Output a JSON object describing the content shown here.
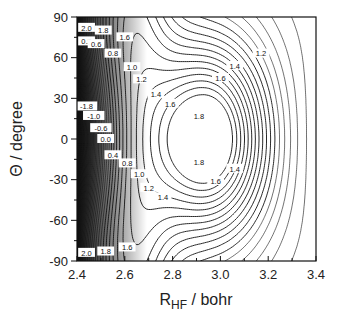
{
  "chart_data": {
    "type": "contour",
    "title": "",
    "xlabel": "R_HF / bohr",
    "xlabel_main": "R",
    "xlabel_sub": "HF",
    "xlabel_rest": " / bohr",
    "ylabel": "Θ / degree",
    "xlim": [
      2.4,
      3.4
    ],
    "ylim": [
      -90,
      90
    ],
    "xticks": [
      "2.4",
      "2.6",
      "2.8",
      "3.0",
      "3.2",
      "3.4"
    ],
    "yticks": [
      "90",
      "60",
      "30",
      "0",
      "-30",
      "-60",
      "-90"
    ],
    "grid": false,
    "legend": null,
    "minimum_region": {
      "R": 2.95,
      "Theta": 0,
      "max_level": 1.8
    },
    "saddle_region": {
      "R": 3.1,
      "Theta": 90
    },
    "contour_levels_labeled": [
      "-1.8",
      "-1.0",
      "-0.6",
      "0.0",
      "0.2",
      "0.4",
      "0.6",
      "0.8",
      "1.0",
      "1.2",
      "1.4",
      "1.6",
      "1.8",
      "2.0"
    ],
    "labels": [
      {
        "text": "2.0",
        "R": 2.44,
        "Theta": 82
      },
      {
        "text": "1.8",
        "R": 2.51,
        "Theta": 80
      },
      {
        "text": "1.6",
        "R": 2.6,
        "Theta": 75
      },
      {
        "text": "0.2",
        "R": 2.44,
        "Theta": 72
      },
      {
        "text": "0.6",
        "R": 2.48,
        "Theta": 70
      },
      {
        "text": "0.8",
        "R": 2.55,
        "Theta": 63
      },
      {
        "text": "1.0",
        "R": 2.63,
        "Theta": 53
      },
      {
        "text": "1.2",
        "R": 2.67,
        "Theta": 44
      },
      {
        "text": "1.4",
        "R": 2.73,
        "Theta": 33
      },
      {
        "text": "1.6",
        "R": 2.79,
        "Theta": 26
      },
      {
        "text": "1.8",
        "R": 2.91,
        "Theta": 17
      },
      {
        "text": "1.6",
        "R": 3.0,
        "Theta": 45
      },
      {
        "text": "1.4",
        "R": 3.06,
        "Theta": 54
      },
      {
        "text": "1.2",
        "R": 3.17,
        "Theta": 63
      },
      {
        "text": "-1.8",
        "R": 2.44,
        "Theta": 24
      },
      {
        "text": "-1.0",
        "R": 2.47,
        "Theta": 17
      },
      {
        "text": "-0.6",
        "R": 2.5,
        "Theta": 8
      },
      {
        "text": "0.0",
        "R": 2.52,
        "Theta": 0
      },
      {
        "text": "0.4",
        "R": 2.55,
        "Theta": -12
      },
      {
        "text": "0.8",
        "R": 2.61,
        "Theta": -18
      },
      {
        "text": "1.0",
        "R": 2.66,
        "Theta": -26
      },
      {
        "text": "1.2",
        "R": 2.7,
        "Theta": -36
      },
      {
        "text": "1.4",
        "R": 2.76,
        "Theta": -43
      },
      {
        "text": "1.8",
        "R": 2.91,
        "Theta": -17
      },
      {
        "text": "1.6",
        "R": 2.98,
        "Theta": -31
      },
      {
        "text": "1.4",
        "R": 3.06,
        "Theta": -22
      },
      {
        "text": "2.0",
        "R": 2.44,
        "Theta": -84
      },
      {
        "text": "1.8",
        "R": 2.52,
        "Theta": -83
      },
      {
        "text": "1.6",
        "R": 2.61,
        "Theta": -80
      }
    ]
  }
}
